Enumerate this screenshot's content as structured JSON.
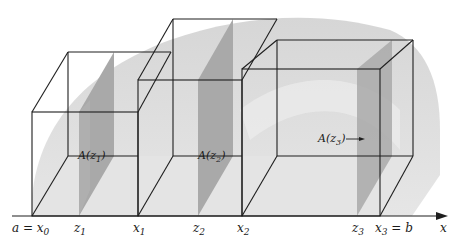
{
  "figure": {
    "colors": {
      "background": "#ffffff",
      "solid_light": "#e2e2e2",
      "solid_mid": "#cfcfcf",
      "cross_section": "#a9a9a9",
      "edges": "#1e1e1e"
    },
    "axis": {
      "label": "x",
      "ticks": [
        {
          "id": "x0",
          "label": "a = x",
          "sub": "0",
          "px": 32
        },
        {
          "id": "z1",
          "label": "z",
          "sub": "1",
          "px": 79
        },
        {
          "id": "x1",
          "label": "x",
          "sub": "1",
          "px": 138
        },
        {
          "id": "z2",
          "label": "z",
          "sub": "2",
          "px": 198
        },
        {
          "id": "x2",
          "label": "x",
          "sub": "2",
          "px": 242
        },
        {
          "id": "z3",
          "label": "z",
          "sub": "3",
          "px": 357
        },
        {
          "id": "x3",
          "label": "x",
          "sub": "3",
          "suffix": " = b",
          "px": 380
        }
      ]
    },
    "slabs": [
      {
        "index": 1,
        "from": "x0",
        "to": "x1",
        "sample": "z1",
        "cross_section_label": "A(z",
        "cross_section_sub": "1",
        "cross_section_close": ")"
      },
      {
        "index": 2,
        "from": "x1",
        "to": "x2",
        "sample": "z2",
        "cross_section_label": "A(z",
        "cross_section_sub": "2",
        "cross_section_close": ")"
      },
      {
        "index": 3,
        "from": "x2",
        "to": "x3",
        "sample": "z3",
        "cross_section_label": "A(z",
        "cross_section_sub": "3",
        "cross_section_close": ")",
        "has_arrow": true
      }
    ]
  }
}
